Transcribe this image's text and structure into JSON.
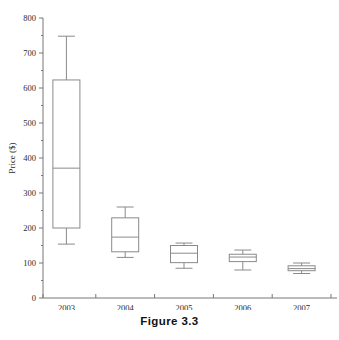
{
  "figure": {
    "caption": "Figure 3.3"
  },
  "chart_data": {
    "type": "box",
    "title": "",
    "xlabel": "",
    "ylabel": "Price ($)",
    "categories": [
      "2003",
      "2004",
      "2005",
      "2006",
      "2007"
    ],
    "ylim": [
      0,
      800
    ],
    "ytick_values": [
      0,
      100,
      200,
      300,
      400,
      500,
      600,
      700,
      800
    ],
    "ytick_labels": [
      "0",
      "100",
      "200",
      "300",
      "400",
      "500",
      "600",
      "700",
      "800"
    ],
    "ytick_minor_step": 50,
    "grid": false,
    "legend": null,
    "boxes": [
      {
        "category": "2003",
        "whisker_low": 154,
        "q1": 200,
        "median": 371,
        "q3": 623,
        "whisker_high": 748
      },
      {
        "category": "2004",
        "whisker_low": 116,
        "q1": 132,
        "median": 174,
        "q3": 229,
        "whisker_high": 260
      },
      {
        "category": "2005",
        "whisker_low": 85,
        "q1": 101,
        "median": 128,
        "q3": 150,
        "whisker_high": 157
      },
      {
        "category": "2006",
        "whisker_low": 80,
        "q1": 104,
        "median": 117,
        "q3": 125,
        "whisker_high": 137
      },
      {
        "category": "2007",
        "whisker_low": 70,
        "q1": 78,
        "median": 84,
        "q3": 92,
        "whisker_high": 100
      }
    ],
    "colors": {
      "stroke": "#8a8a8a",
      "axis": "#777777",
      "text": "#2b2b2b",
      "background": "#ffffff"
    }
  }
}
